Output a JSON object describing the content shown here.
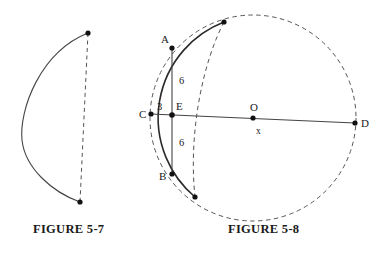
{
  "page": {
    "background_color": "#ffffff",
    "ink_color": "#1a1a1a",
    "line_color": "#444444"
  },
  "figures": [
    {
      "id": "figure-5-7",
      "caption": "FIGURE 5-7",
      "description": "circular arc with dashed chord joining its endpoints",
      "elements": {
        "arc_style": "solid",
        "chord_style": "dashed",
        "endpoints": [
          {
            "name": "arc-top-endpoint",
            "x": 88,
            "y": 33
          },
          {
            "name": "arc-bottom-endpoint",
            "x": 80,
            "y": 202
          }
        ],
        "arc_leftmost_x": 22
      }
    },
    {
      "id": "figure-5-8",
      "caption": "FIGURE 5-8",
      "description": "circle with center O, diameter CD, chord AB intersecting at E",
      "center": {
        "label": "O",
        "x": 253,
        "y": 118
      },
      "radius": 103,
      "points": [
        {
          "label": "A",
          "x": 172,
          "y": 48,
          "label_dx": -11,
          "label_dy": -5
        },
        {
          "label": "B",
          "x": 172,
          "y": 174,
          "label_dx": -13,
          "label_dy": 6
        },
        {
          "label": "C",
          "x": 151,
          "y": 114,
          "label_dx": -12,
          "label_dy": 4
        },
        {
          "label": "D",
          "x": 355,
          "y": 123,
          "label_dx": 6,
          "label_dy": 4
        },
        {
          "label": "E",
          "x": 172,
          "y": 115,
          "label_dx": 4,
          "label_dy": -5
        },
        {
          "label": "O",
          "x": 253,
          "y": 118,
          "label_dx": -3,
          "label_dy": -7
        }
      ],
      "segment_labels": [
        {
          "name": "segment-AE-length",
          "text": "6",
          "x": 179,
          "y": 84
        },
        {
          "name": "segment-CE-length",
          "text": "3",
          "x": 158,
          "y": 110
        },
        {
          "name": "segment-EB-length",
          "text": "6",
          "x": 179,
          "y": 146
        },
        {
          "name": "segment-ED-variable",
          "text": "x",
          "x": 257,
          "y": 133
        }
      ],
      "dashed_arc_endpoints": [
        {
          "name": "dashed-chord-top-endpoint",
          "x": 224,
          "y": 22
        },
        {
          "name": "dashed-chord-bottom-endpoint",
          "x": 195,
          "y": 197
        }
      ],
      "styles": {
        "circle_style": "dashed",
        "left_arc_style": "solid",
        "chord_AB_style": "solid",
        "line_CD_style": "solid",
        "inner_dashed_arc_style": "dashed"
      }
    }
  ]
}
